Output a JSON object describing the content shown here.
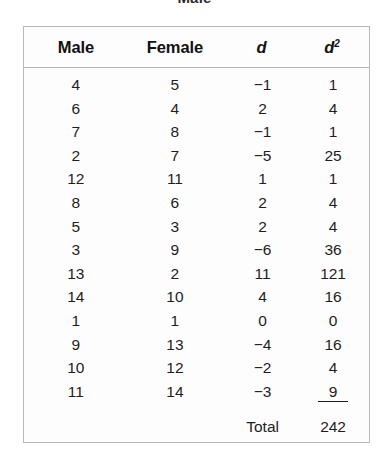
{
  "caption_fragment": "Male",
  "table": {
    "columns": [
      {
        "key": "male",
        "label": "Male",
        "italic": false,
        "superscript": ""
      },
      {
        "key": "female",
        "label": "Female",
        "italic": false,
        "superscript": ""
      },
      {
        "key": "d",
        "label": "d",
        "italic": true,
        "superscript": ""
      },
      {
        "key": "d2",
        "label": "d",
        "italic": true,
        "superscript": "2"
      }
    ],
    "rows": [
      {
        "male": "4",
        "female": "5",
        "d": "−1",
        "d2": "1"
      },
      {
        "male": "6",
        "female": "4",
        "d": "2",
        "d2": "4"
      },
      {
        "male": "7",
        "female": "8",
        "d": "−1",
        "d2": "1"
      },
      {
        "male": "2",
        "female": "7",
        "d": "−5",
        "d2": "25"
      },
      {
        "male": "12",
        "female": "11",
        "d": "1",
        "d2": "1"
      },
      {
        "male": "8",
        "female": "6",
        "d": "2",
        "d2": "4"
      },
      {
        "male": "5",
        "female": "3",
        "d": "2",
        "d2": "4"
      },
      {
        "male": "3",
        "female": "9",
        "d": "−6",
        "d2": "36"
      },
      {
        "male": "13",
        "female": "2",
        "d": "11",
        "d2": "121"
      },
      {
        "male": "14",
        "female": "10",
        "d": "4",
        "d2": "16"
      },
      {
        "male": "1",
        "female": "1",
        "d": "0",
        "d2": "0"
      },
      {
        "male": "9",
        "female": "13",
        "d": "−4",
        "d2": "16"
      },
      {
        "male": "10",
        "female": "12",
        "d": "−2",
        "d2": "4"
      },
      {
        "male": "11",
        "female": "14",
        "d": "−3",
        "d2": "9"
      }
    ],
    "total": {
      "label": "Total",
      "value": "242"
    }
  },
  "colors": {
    "border": "#b9b9b9",
    "text": "#1d1d1d",
    "background": "#fdfdfd"
  }
}
